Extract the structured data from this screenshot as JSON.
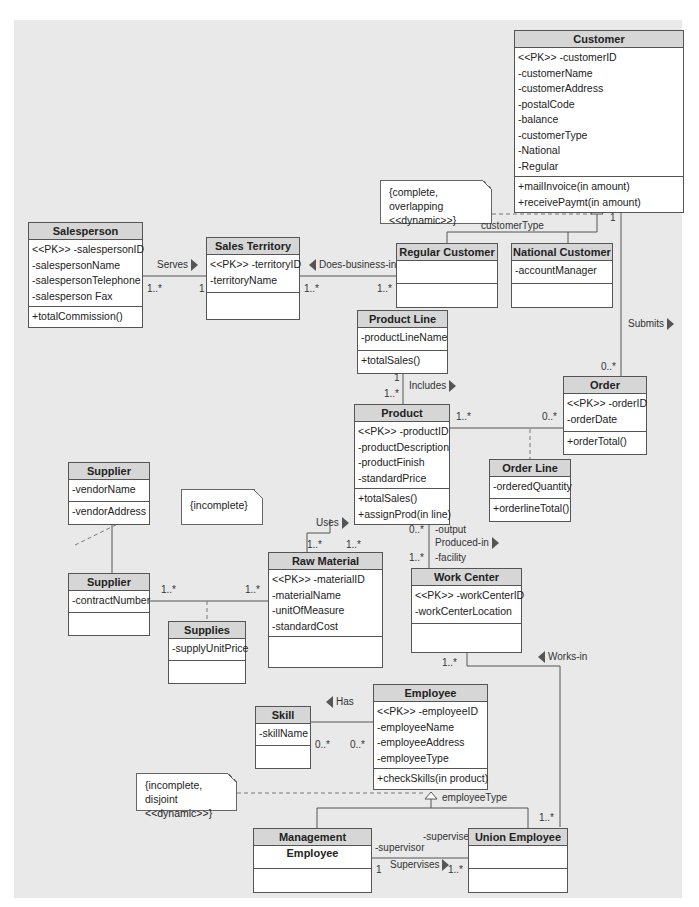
{
  "classes": {
    "customer": {
      "name": "Customer",
      "attributes": [
        "<<PK>> -customerID",
        "-customerName",
        "-customerAddress",
        "-postalCode",
        "-balance",
        "-customerType",
        "-National",
        "-Regular"
      ],
      "operations": [
        "+mailInvoice(in amount)",
        "+receivePaymt(in amount)"
      ]
    },
    "salesperson": {
      "name": "Salesperson",
      "attributes": [
        "<<PK>> -salespersonID",
        "-salespersonName",
        "-salespersonTelephone",
        "-salesperson Fax"
      ],
      "operations": [
        "+totalCommission()"
      ]
    },
    "sales_territory": {
      "name": "Sales Territory",
      "attributes": [
        "<<PK>> -territoryID",
        "-territoryName"
      ],
      "operations": []
    },
    "regular_customer": {
      "name": "Regular Customer",
      "attributes": [],
      "operations": []
    },
    "national_customer": {
      "name": "National Customer",
      "attributes": [
        "-accountManager"
      ],
      "operations": []
    },
    "product_line": {
      "name": "Product Line",
      "attributes": [
        "-productLineName"
      ],
      "operations": [
        "+totalSales()"
      ]
    },
    "order": {
      "name": "Order",
      "attributes": [
        "<<PK>> -orderID",
        "-orderDate"
      ],
      "operations": [
        "+orderTotal()"
      ]
    },
    "product": {
      "name": "Product",
      "attributes": [
        "<<PK>> -productID",
        "-productDescription",
        "-productFinish",
        "-standardPrice"
      ],
      "operations": [
        "+totalSales()",
        "+assignProd(in line)"
      ]
    },
    "order_line": {
      "name": "Order Line",
      "attributes": [
        "-orderedQuantity"
      ],
      "operations": [
        "+orderlineTotal()"
      ]
    },
    "supplier_parent": {
      "name": "Supplier",
      "attributes": [
        "-vendorName"
      ],
      "operations": [
        "-vendorAddress"
      ]
    },
    "supplier_child": {
      "name": "Supplier",
      "attributes": [
        "-contractNumber"
      ],
      "operations": []
    },
    "raw_material": {
      "name": "Raw Material",
      "attributes": [
        "<<PK>> -materialID",
        "-materialName",
        "-unitOfMeasure",
        "-standardCost"
      ],
      "operations": []
    },
    "supplies": {
      "name": "Supplies",
      "attributes": [
        "-supplyUnitPrice"
      ],
      "operations": []
    },
    "work_center": {
      "name": "Work Center",
      "attributes": [
        "<<PK>> -workCenterID",
        "-workCenterLocation"
      ],
      "operations": []
    },
    "skill": {
      "name": "Skill",
      "attributes": [
        "-skillName"
      ],
      "operations": []
    },
    "employee": {
      "name": "Employee",
      "attributes": [
        "<<PK>> -employeeID",
        "-employeeName",
        "-employeeAddress",
        "-employeeType"
      ],
      "operations": [
        "+checkSkills(in product)"
      ]
    },
    "management_employee": {
      "name": "Management Employee",
      "attributes": [],
      "operations": []
    },
    "union_employee": {
      "name": "Union Employee",
      "attributes": [],
      "operations": []
    }
  },
  "notes": {
    "customer_constraint": [
      "{complete, overlapping",
      "<<dynamic>>}"
    ],
    "supplier_constraint": [
      "{incomplete}"
    ],
    "employee_constraint": [
      "{incomplete, disjoint",
      "<<dynamic>>}"
    ]
  },
  "associations": {
    "serves": {
      "name": "Serves",
      "mult_a": "1..*",
      "mult_b": "1"
    },
    "does_business_in": {
      "name": "Does-business-in",
      "mult_a": "1..*",
      "mult_b": "1..*"
    },
    "submits": {
      "name": "Submits",
      "mult_a": "1",
      "mult_b": "0..*"
    },
    "includes": {
      "name": "Includes",
      "mult_a": "1",
      "mult_b": "1..*"
    },
    "product_order": {
      "mult_a": "1..*",
      "mult_b": "0..*"
    },
    "uses": {
      "name": "Uses",
      "mult_a": "1..*",
      "mult_b": "1..*"
    },
    "produced_in": {
      "name": "Produced-in",
      "mult_a": "0..*",
      "mult_b": "1..*",
      "role_a": "-output",
      "role_b": "-facility"
    },
    "supplies": {
      "mult_a": "1..*",
      "mult_b": "1..*"
    },
    "works_in": {
      "name": "Works-in",
      "mult_a": "1..*",
      "mult_b": "1..*"
    },
    "has": {
      "name": "Has",
      "mult_a": "0..*",
      "mult_b": "0..*"
    },
    "supervises": {
      "name": "Supervises",
      "mult_a": "1",
      "mult_b": "1..*",
      "role_a": "-supervisor",
      "role_b": "-supervisee"
    }
  },
  "discriminators": {
    "customer": "customerType",
    "employee": "employeeType"
  }
}
